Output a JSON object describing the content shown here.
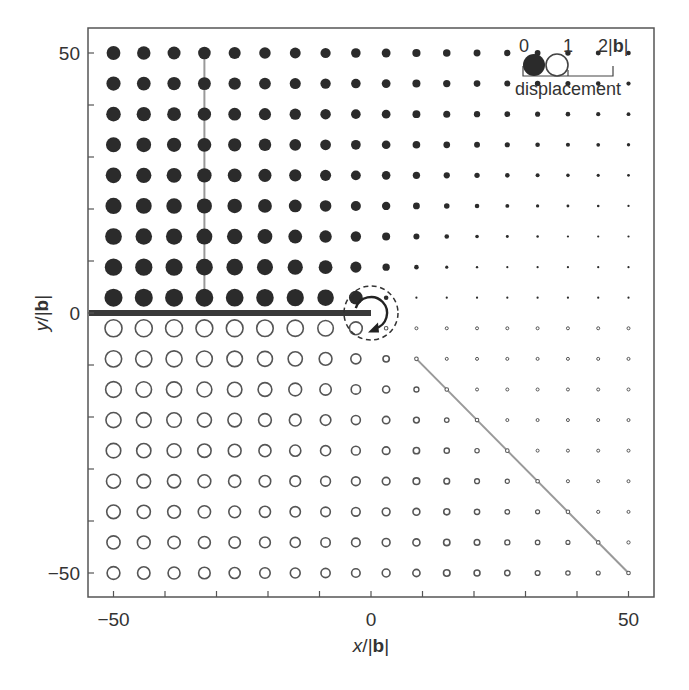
{
  "chart_data": {
    "type": "scatter",
    "title": "",
    "xlabel_italic": "x",
    "xlabel_rest": "/|",
    "xlabel_bold": "b",
    "xlabel_end": "|",
    "ylabel_italic": "y",
    "ylabel_rest": "/|",
    "ylabel_bold": "b",
    "ylabel_end": "|",
    "xlim": [
      -55,
      55
    ],
    "ylim": [
      -54.5,
      55.5
    ],
    "xticks": [
      -50,
      0,
      50
    ],
    "yticks": [
      -50,
      0,
      50
    ],
    "xtick_labels": [
      "−50",
      "0",
      "50"
    ],
    "ytick_labels": [
      "−50",
      "0",
      "50"
    ],
    "minor_tick_step": 10,
    "grid": false,
    "grid_coords": [
      -50,
      -44.12,
      -38.24,
      -32.35,
      -26.47,
      -20.59,
      -14.71,
      -8.82,
      -2.94,
      2.94,
      8.82,
      14.71,
      20.59,
      26.47,
      32.35,
      38.24,
      44.12,
      50
    ],
    "value_quadrant_note": "displacement u = atan2(y,x)/pi; filled marker u>0, open marker u<0; marker radius ∝ |u|",
    "quadrant_values": [
      [
        0.25,
        0.102,
        0.063,
        0.045,
        0.035,
        0.029,
        0.024,
        0.021,
        0.019
      ],
      [
        0.398,
        0.25,
        0.172,
        0.129,
        0.102,
        0.085,
        0.072,
        0.063,
        0.056
      ],
      [
        0.437,
        0.328,
        0.25,
        0.197,
        0.161,
        0.136,
        0.117,
        0.102,
        0.091
      ],
      [
        0.455,
        0.371,
        0.303,
        0.25,
        0.21,
        0.18,
        0.157,
        0.139,
        0.124
      ],
      [
        0.465,
        0.398,
        0.339,
        0.29,
        0.25,
        0.218,
        0.193,
        0.172,
        0.155
      ],
      [
        0.471,
        0.415,
        0.364,
        0.32,
        0.282,
        0.25,
        0.224,
        0.201,
        0.183
      ],
      [
        0.476,
        0.428,
        0.383,
        0.343,
        0.307,
        0.276,
        0.25,
        0.227,
        0.208
      ],
      [
        0.479,
        0.437,
        0.398,
        0.361,
        0.328,
        0.299,
        0.273,
        0.25,
        0.23
      ],
      [
        0.481,
        0.444,
        0.409,
        0.376,
        0.345,
        0.317,
        0.292,
        0.27,
        0.25
      ]
    ],
    "series": [
      {
        "name": "filled (upper half-plane)",
        "style": "filled",
        "color": "#2b2b2b"
      },
      {
        "name": "open (lower half-plane)",
        "style": "open",
        "color": "#555555"
      }
    ],
    "annotations": {
      "cut_plane": {
        "x1": -55,
        "y1": 0,
        "x2": 0,
        "y2": 0,
        "color": "#3a3a3a",
        "width": 6
      },
      "vertical_guide": {
        "x1": -32.35,
        "y1": 50,
        "x2": -32.35,
        "y2": 2.94,
        "color": "#999999"
      },
      "diagonal_guide": {
        "x1": 8.82,
        "y1": -8.82,
        "x2": 50,
        "y2": -50,
        "color": "#999999"
      },
      "dislocation_circle": {
        "cx": 0,
        "cy": 0,
        "r_px": 27,
        "dashed": true
      },
      "burgers_arrow": {
        "cx": 0,
        "cy": 0,
        "r_px": 16
      }
    },
    "legend": {
      "position": "top-right",
      "scale_labels": [
        "0",
        "1",
        "2|"
      ],
      "scale_bold": "b",
      "scale_end": "|",
      "title": "displacement"
    }
  }
}
